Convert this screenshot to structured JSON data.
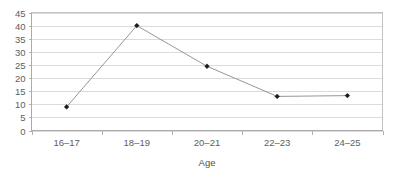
{
  "chart_data": {
    "type": "line",
    "title": "",
    "subtitle": "",
    "xlabel": "Age",
    "ylabel": "",
    "categories": [
      "16–17",
      "18–19",
      "20–21",
      "22–23",
      "24–25"
    ],
    "values": [
      9,
      40,
      24.5,
      13,
      13.3
    ],
    "series": [
      {
        "name": "",
        "values": [
          9,
          40,
          24.5,
          13,
          13.3
        ]
      }
    ],
    "ylim": [
      0,
      45
    ],
    "y_ticks": [
      0,
      5,
      10,
      15,
      20,
      25,
      30,
      35,
      40,
      45
    ],
    "y_tick_labels": [
      "0",
      "5",
      "10",
      "15",
      "20",
      "25",
      "30",
      "35",
      "40",
      "45"
    ],
    "x_tick_labels": [
      "16–17",
      "18–19",
      "20–21",
      "22–23",
      "24–25"
    ],
    "grid": "horizontal",
    "legend": "none",
    "marker": "diamond",
    "colors": {
      "line": "#8a8a8a",
      "marker": "#1b1b1b",
      "gridline": "#d2d2d2",
      "axis": "#a8a8a8",
      "border": "#bdbdbd",
      "text": "#5e5e5e",
      "background": "#ffffff"
    }
  },
  "axis": {
    "x_title": "Age"
  }
}
